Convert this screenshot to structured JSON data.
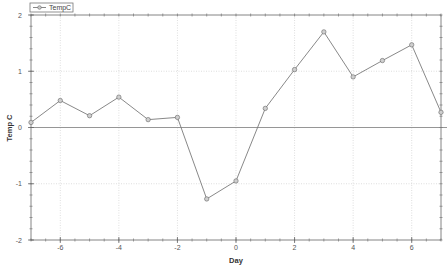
{
  "chart_data": {
    "type": "line",
    "title": "",
    "xlabel": "Day",
    "ylabel": "Temp C",
    "xlim": [
      -7,
      7
    ],
    "ylim": [
      -2,
      2
    ],
    "x_ticks": [
      -6,
      -4,
      -2,
      0,
      2,
      4,
      6
    ],
    "x_tick_labels": [
      "-6",
      "-4",
      "-2",
      "0",
      "2",
      "4",
      "6"
    ],
    "x_minor_step": 0.5,
    "y_ticks": [
      -2,
      -1,
      0,
      1,
      2
    ],
    "y_tick_labels": [
      "-2",
      "-1",
      "0",
      "1",
      "2"
    ],
    "y_minor_step": 0.2,
    "grid": true,
    "zero_line": true,
    "legend": {
      "position": "top-left",
      "entries": [
        "TempC"
      ]
    },
    "series": [
      {
        "name": "TempC",
        "color": "#7a7a7a",
        "marker": "circle",
        "x": [
          -7,
          -6,
          -5,
          -4,
          -3,
          -2,
          -1,
          0,
          1,
          2,
          3,
          4,
          5,
          6,
          7
        ],
        "values": [
          0.09,
          0.48,
          0.21,
          0.54,
          0.14,
          0.18,
          -1.27,
          -0.95,
          0.34,
          1.03,
          1.7,
          0.9,
          1.19,
          1.47,
          0.27
        ]
      }
    ]
  }
}
